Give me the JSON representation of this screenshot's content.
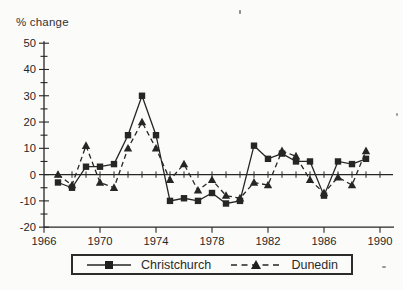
{
  "figure": {
    "title": "% change",
    "ink_color": "#262626",
    "background": "#fbfbfa"
  },
  "chart_data": {
    "type": "line",
    "title": "% change",
    "ylabel": "% change",
    "xlabel": "",
    "x": [
      1967,
      1968,
      1969,
      1970,
      1971,
      1972,
      1973,
      1974,
      1975,
      1976,
      1977,
      1978,
      1979,
      1980,
      1981,
      1982,
      1983,
      1984,
      1985,
      1986,
      1987,
      1988,
      1989
    ],
    "series": [
      {
        "name": "Christchurch",
        "marker": "square",
        "line_style": "solid",
        "values": [
          -3,
          -5,
          3,
          3,
          4,
          15,
          30,
          15,
          -10,
          -9,
          -10,
          -7,
          -11,
          -10,
          11,
          6,
          8,
          5,
          5,
          -8,
          5,
          4,
          6
        ]
      },
      {
        "name": "Dunedin",
        "marker": "triangle",
        "line_style": "dashed",
        "values": [
          0,
          -4,
          11,
          -3,
          -5,
          10,
          20,
          10,
          -2,
          4,
          -6,
          -2,
          -8,
          -9,
          -3,
          -4,
          9,
          7,
          -2,
          -7,
          -1,
          -4,
          9
        ]
      }
    ],
    "xlim": [
      1966,
      1991
    ],
    "ylim": [
      -20,
      50
    ],
    "y_tick_minor_step": 5,
    "y_tick_labeled_step": 10,
    "x_minor_tick_step": 1,
    "baseline": 0,
    "grid": false,
    "legend_position": "bottom"
  },
  "y_axis_labels": [
    "50",
    "40",
    "30",
    "20",
    "10",
    "0",
    "-10",
    "-20"
  ],
  "x_axis_labels": [
    "1966",
    "1970",
    "1974",
    "1978",
    "1982",
    "1986",
    "1990"
  ],
  "legend": {
    "items": [
      {
        "label": "Christchurch",
        "marker_icon": "square-marker-icon",
        "line_style": "solid"
      },
      {
        "label": "Dunedin",
        "marker_icon": "triangle-marker-icon",
        "line_style": "dashed"
      }
    ]
  }
}
